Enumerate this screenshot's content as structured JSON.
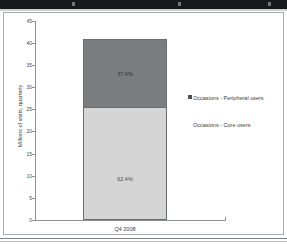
{
  "chart_data": {
    "type": "bar",
    "subtype": "stacked-bar-100-percent-labeled",
    "title": "",
    "xlabel": "",
    "ylabel": "Millions of visits, quarterly",
    "categories": [
      "Q4 2008"
    ],
    "ylim": [
      0,
      45
    ],
    "yticks": [
      0,
      5,
      10,
      15,
      20,
      25,
      30,
      35,
      40,
      45
    ],
    "grid": false,
    "legend_position": "right",
    "series": [
      {
        "name": "Occasions - Core users",
        "values": [
          25.6
        ],
        "data_labels": [
          "62.4%"
        ],
        "color": "#d4d5d4",
        "stack_order": 1
      },
      {
        "name": "Occasions - Peripheral users",
        "values": [
          15.4
        ],
        "data_labels": [
          "37.4%"
        ],
        "color": "#7a7d7f",
        "stack_order": 2
      }
    ],
    "stack_total": [
      41.0
    ]
  },
  "axis": {
    "y_title": "Millions of visits, quarterly",
    "tick_labels": [
      "45",
      "40",
      "35",
      "30",
      "25",
      "20",
      "15",
      "10",
      "5",
      "0"
    ],
    "category_label": "Q4 2008"
  },
  "bar_labels": {
    "peripheral_pct": "37.4%",
    "core_pct": "62.4%",
    "faint_mark": ""
  },
  "legend": {
    "items": [
      {
        "label": "Occasions - Peripheral users",
        "color": "#4f5254"
      },
      {
        "label": "Occasions - Core users",
        "color": "#ffffff"
      }
    ]
  },
  "colors": {
    "peripheral_fill": "#7a7d7f",
    "core_fill": "#d4d5d4",
    "axis": "#8f9294",
    "frame": "#a8abad",
    "text": "#3f4244",
    "top_band": "#16181a"
  }
}
